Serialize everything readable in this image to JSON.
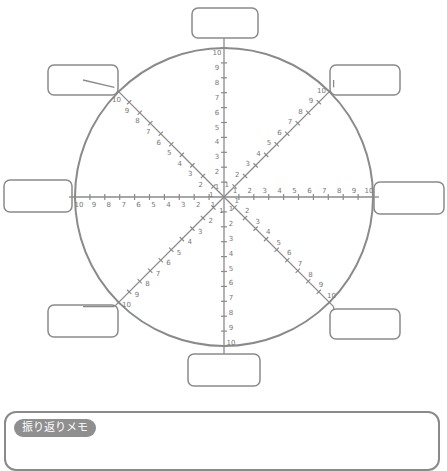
{
  "diagram": {
    "type": "radar-wheel-worksheet",
    "center": [
      224,
      197
    ],
    "radius": 149,
    "stroke_color": "#8a8a8a",
    "spokes": 8,
    "scale_labels": [
      "1",
      "2",
      "3",
      "4",
      "5",
      "6",
      "7",
      "8",
      "9",
      "10"
    ],
    "max_label": "10",
    "label_boxes": [
      {
        "position": "top",
        "text": ""
      },
      {
        "position": "top-right",
        "text": ""
      },
      {
        "position": "right",
        "text": ""
      },
      {
        "position": "bottom-right",
        "text": ""
      },
      {
        "position": "bottom",
        "text": ""
      },
      {
        "position": "bottom-left",
        "text": ""
      },
      {
        "position": "left",
        "text": ""
      },
      {
        "position": "top-left",
        "text": ""
      }
    ]
  },
  "memo": {
    "label": "振り返りメモ",
    "content": ""
  }
}
